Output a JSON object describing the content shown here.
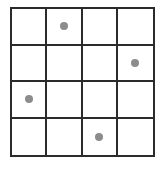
{
  "puzzle": {
    "name": "dot-grid-puzzle",
    "rows": 4,
    "columns": 4,
    "grid_line_color": "#2b2b2b",
    "background_color": "#ffffff",
    "dot_color": "#8c8c8c",
    "dot_diameter_px": 8,
    "dot_count": 4,
    "dots": [
      {
        "row": 1,
        "column": 2
      },
      {
        "row": 2,
        "column": 4
      },
      {
        "row": 3,
        "column": 1
      },
      {
        "row": 4,
        "column": 3
      }
    ],
    "cells": [
      {
        "row": 1,
        "column": 1,
        "filled": false
      },
      {
        "row": 1,
        "column": 2,
        "filled": true
      },
      {
        "row": 1,
        "column": 3,
        "filled": false
      },
      {
        "row": 1,
        "column": 4,
        "filled": false
      },
      {
        "row": 2,
        "column": 1,
        "filled": false
      },
      {
        "row": 2,
        "column": 2,
        "filled": false
      },
      {
        "row": 2,
        "column": 3,
        "filled": false
      },
      {
        "row": 2,
        "column": 4,
        "filled": true
      },
      {
        "row": 3,
        "column": 1,
        "filled": true
      },
      {
        "row": 3,
        "column": 2,
        "filled": false
      },
      {
        "row": 3,
        "column": 3,
        "filled": false
      },
      {
        "row": 3,
        "column": 4,
        "filled": false
      },
      {
        "row": 4,
        "column": 1,
        "filled": false
      },
      {
        "row": 4,
        "column": 2,
        "filled": false
      },
      {
        "row": 4,
        "column": 3,
        "filled": true
      },
      {
        "row": 4,
        "column": 4,
        "filled": false
      }
    ]
  }
}
